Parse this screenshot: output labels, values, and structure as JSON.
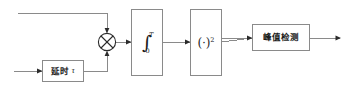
{
  "diagram": {
    "colors": {
      "wire": "#8a8a8a",
      "box_border": "#8a8a8a",
      "box_fill": "#ffffff",
      "arrow": "#2b2b2b",
      "text": "#1c1c1c",
      "background": "#ffffff"
    },
    "blocks": [
      {
        "id": "delay",
        "name": "delay-block",
        "label": "延时",
        "param": "τ",
        "x": 42,
        "y": 60,
        "w": 42,
        "h": 22
      },
      {
        "id": "integrator",
        "name": "integrator-block",
        "symbol": "∫",
        "upper_limit": "T",
        "lower_limit": "0",
        "x": 131,
        "y": 9,
        "w": 32,
        "h": 67
      },
      {
        "id": "squarer",
        "name": "squarer-block",
        "open_paren": "(",
        "center_dot": "·",
        "close_paren": ")",
        "exponent": "2",
        "x": 190,
        "y": 9,
        "w": 32,
        "h": 67
      },
      {
        "id": "peak_detect",
        "name": "peak-detection-block",
        "label": "峰值检测",
        "x": 252,
        "y": 24,
        "w": 58,
        "h": 27
      }
    ],
    "operators": [
      {
        "id": "multiplier",
        "name": "multiplier-node",
        "glyph": "⊗",
        "cx": 107,
        "cy": 42,
        "r": 9
      }
    ],
    "signal_flow": [
      "input-top",
      "input-bottom",
      "delay",
      "multiplier",
      "integrator",
      "squarer",
      "peak-detection",
      "output"
    ]
  }
}
